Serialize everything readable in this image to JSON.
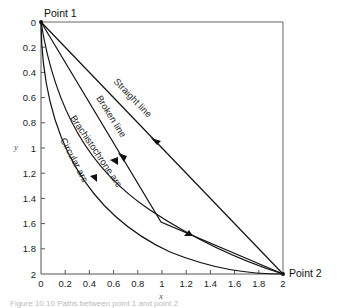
{
  "diagram": {
    "points": {
      "start": {
        "label": "Point 1",
        "x": 0,
        "y": 0
      },
      "end": {
        "label": "Point 2",
        "x": 2,
        "y": 2
      }
    },
    "axes": {
      "xlabel": "x",
      "ylabel": "y",
      "x_ticks": [
        "0",
        "0.2",
        "0.4",
        "0.6",
        "0.8",
        "1",
        "1.2",
        "1.4",
        "1.6",
        "1.8",
        "2"
      ],
      "y_ticks": [
        "0",
        "0.2",
        "0.4",
        "0.6",
        "0.8",
        "1",
        "1.2",
        "1.4",
        "1.6",
        "1.8",
        "2"
      ],
      "y_inverted": true
    },
    "curves": [
      {
        "name": "straight-line",
        "label": "Straight line"
      },
      {
        "name": "broken-line",
        "label": "Broken line",
        "vertex": [
          1.0,
          1.58
        ]
      },
      {
        "name": "brachistochrone-arc",
        "label": "Brachistochrone arc"
      },
      {
        "name": "circular-arc",
        "label": "Circular arc"
      }
    ],
    "caption": "Figure 10.10  Paths between point 1 and point 2"
  }
}
